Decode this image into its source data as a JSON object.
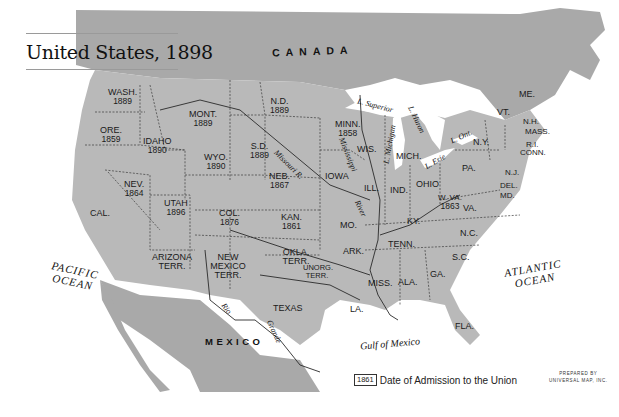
{
  "title": "United States, 1898",
  "countries": {
    "canada": "CANADA",
    "mexico": "MEXICO"
  },
  "oceans": {
    "pacific": [
      "PACIFIC",
      "OCEAN"
    ],
    "atlantic": [
      "ATLANTIC",
      "OCEAN"
    ],
    "gulf": "Gulf of Mexico"
  },
  "lakes": {
    "superior": "L. Superior",
    "michigan": "L. Michigan",
    "huron": "L. Huron",
    "erie": "L. Erie",
    "ontario": "L. Ont."
  },
  "rivers": {
    "missouri": "Missouri R.",
    "mississippi": "Mississippi",
    "mississippi_river": "River",
    "rio": "Rio",
    "grande": "Grande"
  },
  "states": [
    {
      "abbr": "WASH.",
      "year": "1889"
    },
    {
      "abbr": "ORE.",
      "year": "1859"
    },
    {
      "abbr": "IDAHO",
      "year": "1890"
    },
    {
      "abbr": "MONT.",
      "year": "1889"
    },
    {
      "abbr": "N.D.",
      "year": "1889"
    },
    {
      "abbr": "S.D.",
      "year": "1889"
    },
    {
      "abbr": "MINN.",
      "year": "1858"
    },
    {
      "abbr": "WYO.",
      "year": "1890"
    },
    {
      "abbr": "NEB.",
      "year": "1867"
    },
    {
      "abbr": "NEV.",
      "year": "1864"
    },
    {
      "abbr": "UTAH",
      "year": "1896"
    },
    {
      "abbr": "COL.",
      "year": "1876"
    },
    {
      "abbr": "KAN.",
      "year": "1861"
    },
    {
      "abbr": "CAL.",
      "year": ""
    },
    {
      "abbr": "ARIZONA TERR.",
      "year": ""
    },
    {
      "abbr": "NEW MEXICO TERR.",
      "year": ""
    },
    {
      "abbr": "OKLA. TERR.",
      "year": ""
    },
    {
      "abbr": "UNORG. TERR.",
      "year": ""
    },
    {
      "abbr": "TEXAS",
      "year": ""
    },
    {
      "abbr": "IOWA",
      "year": ""
    },
    {
      "abbr": "MO.",
      "year": ""
    },
    {
      "abbr": "ARK.",
      "year": ""
    },
    {
      "abbr": "LA.",
      "year": ""
    },
    {
      "abbr": "WIS.",
      "year": ""
    },
    {
      "abbr": "ILL.",
      "year": ""
    },
    {
      "abbr": "MICH.",
      "year": ""
    },
    {
      "abbr": "IND.",
      "year": ""
    },
    {
      "abbr": "OHIO",
      "year": ""
    },
    {
      "abbr": "KY.",
      "year": ""
    },
    {
      "abbr": "TENN.",
      "year": ""
    },
    {
      "abbr": "MISS.",
      "year": ""
    },
    {
      "abbr": "ALA.",
      "year": ""
    },
    {
      "abbr": "GA.",
      "year": ""
    },
    {
      "abbr": "FLA.",
      "year": ""
    },
    {
      "abbr": "S.C.",
      "year": ""
    },
    {
      "abbr": "N.C.",
      "year": ""
    },
    {
      "abbr": "VA.",
      "year": ""
    },
    {
      "abbr": "W. VA.",
      "year": "1863"
    },
    {
      "abbr": "PA.",
      "year": ""
    },
    {
      "abbr": "N.Y.",
      "year": ""
    },
    {
      "abbr": "VT.",
      "year": ""
    },
    {
      "abbr": "ME.",
      "year": ""
    },
    {
      "abbr": "N.H.",
      "year": ""
    },
    {
      "abbr": "MASS.",
      "year": ""
    },
    {
      "abbr": "R.I.",
      "year": ""
    },
    {
      "abbr": "CONN.",
      "year": ""
    },
    {
      "abbr": "N.J.",
      "year": ""
    },
    {
      "abbr": "DEL.",
      "year": ""
    },
    {
      "abbr": "MD.",
      "year": ""
    }
  ],
  "legend": {
    "sample_year": "1861",
    "text": "Date of Admission to the Union"
  },
  "credit": [
    "PREPARED BY",
    "UNIVERSAL MAP, INC."
  ],
  "colors": {
    "land_us": "#b9b9b9",
    "land_foreign": "#a8a8a8",
    "water": "#ffffff",
    "border": "#3a3a3a"
  }
}
